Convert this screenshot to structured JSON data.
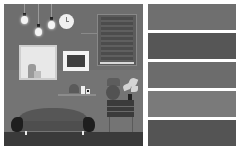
{
  "scene": {
    "description": "Interior room illustration with pendant bulbs, wall clock, window blind, framed pictures, sofa, lamp, plant and side table",
    "colors": {
      "wall": "#6e6e6e",
      "wall_lower": "#747474",
      "floor": "#3a3a3a"
    }
  },
  "palette": {
    "swatches": [
      {
        "color": "#6f6f6f"
      },
      {
        "color": "#565656"
      },
      {
        "color": "#6c6c6c"
      },
      {
        "color": "#7a7a7a"
      },
      {
        "color": "#545454"
      }
    ]
  }
}
